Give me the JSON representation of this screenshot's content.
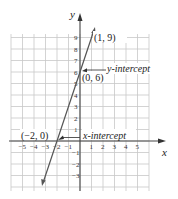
{
  "graph": {
    "x_axis_label": "x",
    "y_axis_label": "y",
    "x_ticks": [
      "−5",
      "−4",
      "−3",
      "−2",
      "−1",
      "1",
      "2",
      "3",
      "4",
      "5"
    ],
    "x_tick_values": [
      -5,
      -4,
      -3,
      -2,
      -1,
      1,
      2,
      3,
      4,
      5
    ],
    "y_ticks": [
      "9",
      "8",
      "7",
      "6",
      "5",
      "4",
      "3",
      "2",
      "1",
      "−1",
      "−2",
      "−3"
    ],
    "y_tick_values": [
      9,
      8,
      7,
      6,
      5,
      4,
      3,
      2,
      1,
      -1,
      -2,
      -3
    ],
    "points": [
      {
        "label": "(1, 9)",
        "x": 1,
        "y": 9
      },
      {
        "label": "(0, 6)",
        "x": 0,
        "y": 6
      },
      {
        "label": "(−2, 0)",
        "x": -2,
        "y": 0
      }
    ],
    "annotations": {
      "y_intercept": "y-intercept",
      "x_intercept": "x-intercept"
    },
    "line": {
      "slope": 3,
      "intercept": 6,
      "equation": "y = 3x + 6"
    },
    "colors": {
      "grid": "#c8c8c8",
      "axis": "#444444",
      "line": "#555555"
    }
  },
  "chart_data": {
    "type": "line",
    "title": "",
    "xlabel": "x",
    "ylabel": "y",
    "xlim": [
      -6,
      6
    ],
    "ylim": [
      -4,
      10
    ],
    "grid": true,
    "series": [
      {
        "name": "y = 3x + 6",
        "x": [
          -3.2,
          -2,
          0,
          1,
          1.2
        ],
        "y": [
          -3.6,
          0,
          6,
          9,
          9.6
        ]
      }
    ],
    "annotations": [
      {
        "text": "(1, 9)",
        "x": 1,
        "y": 9
      },
      {
        "text": "(0, 6)",
        "x": 0,
        "y": 6
      },
      {
        "text": "y-intercept",
        "x": 0,
        "y": 6
      },
      {
        "text": "(−2, 0)",
        "x": -2,
        "y": 0
      },
      {
        "text": "x-intercept",
        "x": -2,
        "y": 0
      }
    ]
  }
}
